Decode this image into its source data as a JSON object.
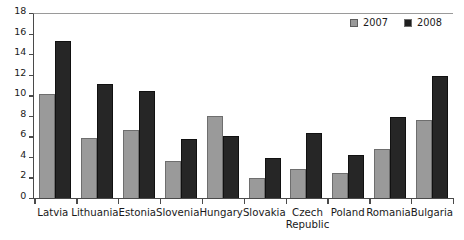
{
  "chart_data": {
    "type": "bar",
    "title": "",
    "subtitle": "",
    "xlabel": "",
    "ylabel": "",
    "ylim": [
      0,
      18
    ],
    "ytick_step": 2,
    "yticks": [
      18,
      16,
      14,
      12,
      10,
      8,
      6,
      4,
      2,
      0
    ],
    "grid": false,
    "legend_position": "top-right",
    "categories": [
      "Latvia",
      "Lithuania",
      "Estonia",
      "Slovenia",
      "Hungary",
      "Slovakia",
      "Czech Republic",
      "Poland",
      "Romania",
      "Bulgaria"
    ],
    "category_lines": [
      [
        "Latvia"
      ],
      [
        "Lithuania"
      ],
      [
        "Estonia"
      ],
      [
        "Slovenia"
      ],
      [
        "Hungary"
      ],
      [
        "Slovakia"
      ],
      [
        "Czech",
        "Republic"
      ],
      [
        "Poland"
      ],
      [
        "Romania"
      ],
      [
        "Bulgaria"
      ]
    ],
    "series": [
      {
        "name": "2007",
        "color": "#9a9a9a",
        "values": [
          10.1,
          5.8,
          6.6,
          3.6,
          8.0,
          1.9,
          2.8,
          2.4,
          4.8,
          7.6
        ]
      },
      {
        "name": "2008",
        "color": "#262626",
        "values": [
          15.3,
          11.1,
          10.4,
          5.7,
          6.0,
          3.9,
          6.3,
          4.2,
          7.9,
          11.9
        ]
      }
    ]
  },
  "legend": {
    "entries": [
      {
        "label": "2007",
        "swatch": "legend-swatch-2007"
      },
      {
        "label": "2008",
        "swatch": "legend-swatch-2008"
      }
    ]
  },
  "colors": {
    "series_2007": "#9a9a9a",
    "series_2008": "#262626",
    "axis": "#4a4a4a",
    "frame_top": "#9a9a9a",
    "background": "#ffffff",
    "text": "#1a1a1a"
  }
}
